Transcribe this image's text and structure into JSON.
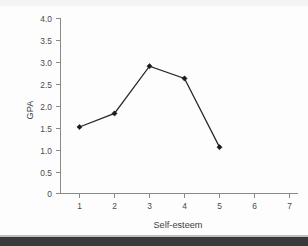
{
  "chart_data": {
    "type": "line",
    "title": "",
    "xlabel": "Self-esteem",
    "ylabel": "GPA",
    "x": [
      1,
      2,
      3,
      4,
      5
    ],
    "values": [
      1.52,
      1.83,
      2.91,
      2.63,
      1.06
    ],
    "series": [
      {
        "name": "GPA",
        "values": [
          1.52,
          1.83,
          2.91,
          2.63,
          1.06
        ]
      }
    ],
    "xlim": [
      0.6,
      7.4
    ],
    "ylim": [
      0,
      4.0
    ],
    "xticks": [
      1,
      2,
      3,
      4,
      5,
      6,
      7
    ],
    "yticks": [
      0,
      0.5,
      1.0,
      1.5,
      2.0,
      2.5,
      3.0,
      3.5,
      4.0
    ],
    "xtick_labels": [
      "1",
      "2",
      "3",
      "4",
      "5",
      "6",
      "7"
    ],
    "ytick_labels": [
      "0",
      "0.5",
      "1.0",
      "1.5",
      "2.0",
      "2.5",
      "3.0",
      "3.5",
      "4.0"
    ],
    "grid": false,
    "legend": null,
    "legend_position": "none",
    "marker": "diamond",
    "line_color": "#262626",
    "marker_color": "#1c1c1c",
    "axis_color": "#8a8a8a",
    "background_color": "#fdfdfd"
  },
  "axis": {
    "y_title": "GPA",
    "x_title": "Self-esteem"
  },
  "ytick": {
    "t0": "4.0",
    "t1": "3.5",
    "t2": "3.0",
    "t3": "2.5",
    "t4": "2.0",
    "t5": "1.5",
    "t6": "1.0",
    "t7": "0.5",
    "t8": "0"
  },
  "xtick": {
    "t0": "1",
    "t1": "2",
    "t2": "3",
    "t3": "4",
    "t4": "5",
    "t5": "6",
    "t6": "7"
  }
}
